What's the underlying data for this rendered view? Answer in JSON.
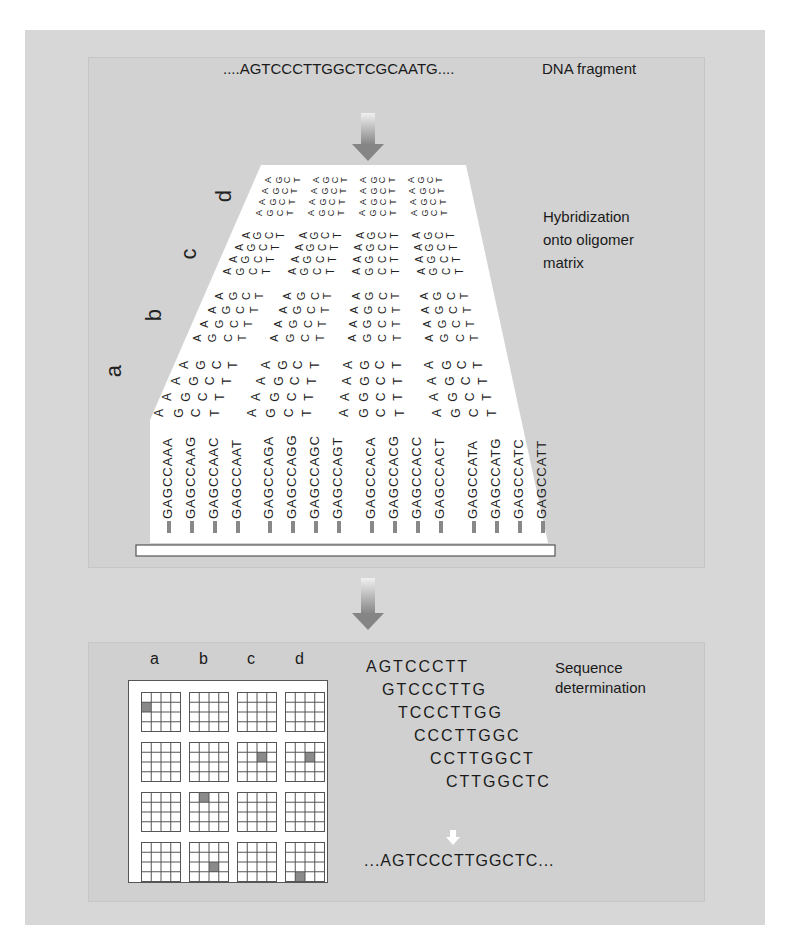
{
  "figure": {
    "top_panel": {
      "fragment_sequence": "....AGTCCCTTGGCTCGCAATG....",
      "fragment_label": "DNA fragment",
      "hybridization_label": "Hybridization\nonto oligomer\nmatrix",
      "row_letters": [
        "a",
        "b",
        "c",
        "d"
      ],
      "oligomers": [
        "GAGCCAAA",
        "GAGCCAAG",
        "GAGCCAAC",
        "GAGCCAAT",
        "GAGCCAGA",
        "GAGCCAGG",
        "GAGCCAGC",
        "GAGCCAGT",
        "GAGCCACA",
        "GAGCCACG",
        "GAGCCACC",
        "GAGCCACT",
        "GAGCCATA",
        "GAGCCATG",
        "GAGCCATC",
        "GAGCCATT"
      ],
      "matrix_bases": [
        "A",
        "G",
        "C",
        "T"
      ]
    },
    "bottom_panel": {
      "column_labels": [
        "a",
        "b",
        "c",
        "d"
      ],
      "grid": {
        "rows": 4,
        "cols": 4,
        "cell_subgrid": 4,
        "highlights": [
          {
            "row": 0,
            "col": 0,
            "sub_row": 1,
            "sub_col": 0
          },
          {
            "row": 1,
            "col": 2,
            "sub_row": 1,
            "sub_col": 2
          },
          {
            "row": 1,
            "col": 3,
            "sub_row": 1,
            "sub_col": 2
          },
          {
            "row": 2,
            "col": 1,
            "sub_row": 0,
            "sub_col": 1
          },
          {
            "row": 3,
            "col": 1,
            "sub_row": 2,
            "sub_col": 2
          },
          {
            "row": 3,
            "col": 3,
            "sub_row": 3,
            "sub_col": 1
          }
        ],
        "highlight_color": "#8a8a8a"
      },
      "overlapping_sequences": [
        "AGTCCCTT",
        "GTCCCTTG",
        "TCCCTTGG",
        "CCCTTGGC",
        "CCTTGGCT",
        "CTTGGCTC"
      ],
      "result_sequence": "...AGTCCCTTGGCTC...",
      "sequence_label": "Sequence\ndetermination"
    },
    "colors": {
      "outer_background": "#d7d7d7",
      "panel_background": "#d2d2d2",
      "arrow_color": "#8c8c8c",
      "matrix_white": "#ffffff",
      "text": "#1a1a1a"
    }
  }
}
